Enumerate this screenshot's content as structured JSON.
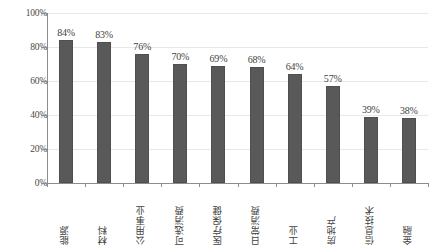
{
  "chart_data": {
    "type": "bar",
    "title": "",
    "xlabel": "",
    "ylabel": "",
    "ylim": [
      0,
      100
    ],
    "yticks": [
      "0%",
      "20%",
      "40%",
      "60%",
      "80%",
      "100%"
    ],
    "ytick_values": [
      0,
      20,
      40,
      60,
      80,
      100
    ],
    "grid": true,
    "legend": "none",
    "bar_color": "#595959",
    "categories": [
      "能源",
      "材料",
      "公用事业",
      "可选消费",
      "医疗保健",
      "日常消费",
      "工业",
      "房地产",
      "信息技术",
      "金融"
    ],
    "values": [
      84,
      83,
      76,
      70,
      69,
      68,
      64,
      57,
      39,
      38
    ],
    "value_labels": [
      "84%",
      "83%",
      "76%",
      "70%",
      "69%",
      "68%",
      "64%",
      "57%",
      "39%",
      "38%"
    ]
  }
}
